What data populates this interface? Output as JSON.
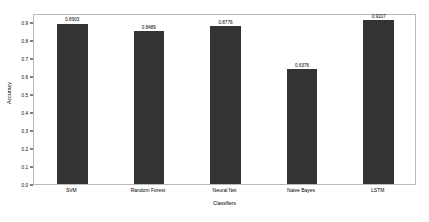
{
  "chart_data": {
    "type": "bar",
    "title": "",
    "subtitle": "",
    "xlabel": "Classifiers",
    "ylabel": "Accuracy",
    "categories": [
      "SVM",
      "Random Forest",
      "Neural Net",
      "Naive Bayes",
      "LSTM"
    ],
    "values": [
      0.8903,
      0.8489,
      0.8776,
      0.6376,
      0.9107
    ],
    "value_labels": [
      "0.8903",
      "0.8489",
      "0.8776",
      "0.6376",
      "0.9107"
    ],
    "ylim": [
      0.0,
      0.95
    ],
    "yticks": [
      0.0,
      0.1,
      0.2,
      0.3,
      0.4,
      0.5,
      0.6,
      0.7,
      0.8,
      0.9
    ],
    "ytick_labels": [
      "0.0",
      "0.1",
      "0.2",
      "0.3",
      "0.4",
      "0.5",
      "0.6",
      "0.7",
      "0.8",
      "0.9"
    ],
    "grid": false,
    "legend": false,
    "legend_position": "none",
    "bar_color": "#333333",
    "background_color": "#ffffff",
    "frame_color": "#b9b9b9"
  }
}
